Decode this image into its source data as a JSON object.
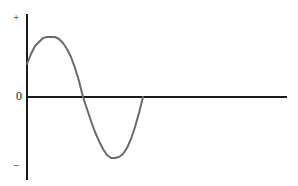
{
  "figure": {
    "name": "sine-wave-axis-diagram",
    "background_color": "#ffffff",
    "width": 298,
    "height": 186
  },
  "axes": {
    "vertical_axis_name": "amplitude-axis",
    "horizontal_axis_name": "time-axis",
    "axis_color": "#1a1a1a",
    "axis_stroke_width": 2,
    "origin_x": 27,
    "origin_y": 97,
    "vertical_axis_top_y": 14,
    "vertical_axis_bottom_y": 180,
    "horizontal_axis_right_x": 287,
    "labels": {
      "positive": "+",
      "zero": "0",
      "negative": "−"
    }
  },
  "chart_data": {
    "type": "line",
    "title": "",
    "xlabel": "",
    "ylabel": "",
    "grid": false,
    "legend": null,
    "series": [
      {
        "name": "sine-wave",
        "color": "#6b6b6b",
        "stroke_width": 2,
        "description": "One full cycle of a sine wave starting part-way up the rising edge, peaking positive, crossing zero, dipping negative, and returning to zero where it terminates.",
        "annotations": {
          "start_point": [
            27,
            64
          ],
          "positive_peak": [
            55,
            37
          ],
          "descending_zero_crossing": [
            83,
            97
          ],
          "negative_trough": [
            111,
            158
          ],
          "end_point": [
            143,
            97
          ]
        },
        "x": [
          27,
          31,
          35,
          39,
          43,
          47,
          51,
          55,
          59,
          63,
          67,
          71,
          75,
          79,
          83,
          87,
          91,
          95,
          99,
          103,
          107,
          111,
          115,
          119,
          123,
          127,
          131,
          135,
          139,
          143
        ],
        "y": [
          64,
          54,
          46,
          42,
          38,
          37,
          37,
          37,
          39,
          43,
          49,
          57,
          68,
          81,
          97,
          109,
          121,
          132,
          141,
          149,
          155,
          158,
          158,
          157,
          154,
          148,
          139,
          127,
          113,
          97
        ],
        "x_pixel_range": [
          27,
          143
        ],
        "y_pixel_range": [
          37,
          158
        ],
        "zero_line_pixel_y": 97,
        "amplitude_pixels": 60
      }
    ]
  }
}
